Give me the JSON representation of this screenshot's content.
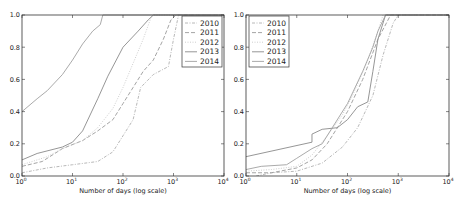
{
  "chart_data": [
    {
      "type": "line",
      "title": "",
      "xlabel": "Number of days (log scale)",
      "ylabel": "",
      "xscale": "log",
      "xlim": [
        1,
        10000
      ],
      "ylim": [
        0.0,
        1.0
      ],
      "x_ticks": [
        "10^0",
        "10^1",
        "10^2",
        "10^3",
        "10^4"
      ],
      "y_ticks": [
        "0.0",
        "0.2",
        "0.4",
        "0.6",
        "0.8",
        "1.0"
      ],
      "grid": false,
      "legend_position": "upper right",
      "series": [
        {
          "name": "2010",
          "style": "dashdot",
          "color": "#b0b0b0",
          "log10x": [
            0,
            0.5,
            1.0,
            1.5,
            1.8,
            2.0,
            2.2,
            2.35,
            2.6,
            2.9,
            3.0,
            3.1
          ],
          "y": [
            0.02,
            0.05,
            0.07,
            0.09,
            0.15,
            0.25,
            0.35,
            0.55,
            0.63,
            0.68,
            0.85,
            1.0
          ]
        },
        {
          "name": "2011",
          "style": "dashed",
          "color": "#9a9a9a",
          "log10x": [
            0,
            0.4,
            0.8,
            1.2,
            1.5,
            1.8,
            2.0,
            2.2,
            2.4,
            2.6,
            2.8,
            2.95,
            3.05
          ],
          "y": [
            0.06,
            0.09,
            0.17,
            0.22,
            0.28,
            0.35,
            0.45,
            0.55,
            0.65,
            0.72,
            0.85,
            0.97,
            1.0
          ]
        },
        {
          "name": "2012",
          "style": "dotted",
          "color": "#c8c8c8",
          "log10x": [
            0,
            0.5,
            0.8,
            1.2,
            1.5,
            1.8,
            2.0,
            2.2,
            2.4,
            2.55,
            2.6
          ],
          "y": [
            0.07,
            0.12,
            0.17,
            0.22,
            0.3,
            0.42,
            0.55,
            0.7,
            0.85,
            0.98,
            1.0
          ]
        },
        {
          "name": "2013",
          "style": "solid",
          "color": "#8a8a8a",
          "log10x": [
            0,
            0.3,
            0.8,
            1.0,
            1.2,
            1.5,
            1.7,
            2.0,
            2.3,
            2.5,
            2.6
          ],
          "y": [
            0.1,
            0.14,
            0.18,
            0.21,
            0.28,
            0.48,
            0.62,
            0.8,
            0.9,
            0.97,
            1.0
          ]
        },
        {
          "name": "2014",
          "style": "solid",
          "color": "#a0a0a0",
          "log10x": [
            0,
            0.3,
            0.5,
            0.8,
            1.0,
            1.2,
            1.4,
            1.55,
            1.6
          ],
          "y": [
            0.4,
            0.48,
            0.53,
            0.63,
            0.72,
            0.82,
            0.9,
            0.94,
            1.0
          ]
        }
      ]
    },
    {
      "type": "line",
      "title": "",
      "xlabel": "Number of days (log scale)",
      "ylabel": "",
      "xscale": "log",
      "xlim": [
        1,
        10000
      ],
      "ylim": [
        0.0,
        1.0
      ],
      "x_ticks": [
        "10^0",
        "10^1",
        "10^2",
        "10^3",
        "10^4"
      ],
      "y_ticks": [
        "0.0",
        "0.2",
        "0.4",
        "0.6",
        "0.8",
        "1.0"
      ],
      "grid": false,
      "legend_position": "upper left",
      "series": [
        {
          "name": "2010",
          "style": "dashdot",
          "color": "#b0b0b0",
          "log10x": [
            0.2,
            0.5,
            1.0,
            1.5,
            1.9,
            2.2,
            2.5,
            2.7,
            2.9,
            3.0
          ],
          "y": [
            0.0,
            0.02,
            0.03,
            0.08,
            0.18,
            0.3,
            0.5,
            0.75,
            0.95,
            1.0
          ]
        },
        {
          "name": "2011",
          "style": "dashed",
          "color": "#9a9a9a",
          "log10x": [
            0,
            0.5,
            1.0,
            1.3,
            1.6,
            2.0,
            2.3,
            2.6,
            2.85
          ],
          "y": [
            0.02,
            0.02,
            0.05,
            0.1,
            0.2,
            0.4,
            0.6,
            0.85,
            1.0
          ]
        },
        {
          "name": "2012",
          "style": "dotted",
          "color": "#c8c8c8",
          "log10x": [
            0,
            0.5,
            1.0,
            1.3,
            1.6,
            1.9,
            2.1,
            2.4,
            2.6,
            2.7
          ],
          "y": [
            0.03,
            0.04,
            0.06,
            0.13,
            0.25,
            0.38,
            0.5,
            0.72,
            0.9,
            1.0
          ]
        },
        {
          "name": "2013",
          "style": "solid",
          "color": "#8a8a8a",
          "log10x": [
            0,
            1.3,
            1.3,
            1.5,
            1.8,
            2.0,
            2.2,
            2.4,
            2.5,
            2.6,
            2.75
          ],
          "y": [
            0.12,
            0.21,
            0.26,
            0.29,
            0.3,
            0.35,
            0.43,
            0.46,
            0.65,
            0.85,
            1.0
          ]
        },
        {
          "name": "2014",
          "style": "solid",
          "color": "#a0a0a0",
          "log10x": [
            0,
            0.3,
            0.8,
            1.0,
            1.3,
            1.5,
            1.7,
            2.0,
            2.3,
            2.5,
            2.6,
            2.75
          ],
          "y": [
            0.04,
            0.06,
            0.07,
            0.11,
            0.17,
            0.2,
            0.3,
            0.45,
            0.65,
            0.8,
            0.9,
            1.0
          ]
        }
      ]
    }
  ],
  "panels": [
    {
      "x0": 22,
      "x1": 224,
      "y0": 15,
      "y1": 176,
      "legend": {
        "x": 182,
        "y": 16,
        "w": 40,
        "h": 51
      }
    },
    {
      "x0": 246,
      "x1": 449,
      "y0": 15,
      "y1": 176,
      "legend": {
        "x": 249,
        "y": 16,
        "w": 40,
        "h": 51
      }
    }
  ]
}
